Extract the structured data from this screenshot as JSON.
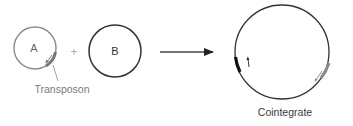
{
  "diagram": {
    "plasmid_a": {
      "label": "A",
      "stroke": "#8a8a8a",
      "transposon_color": "#7a7a7a"
    },
    "operator_plus": "+",
    "plasmid_b": {
      "label": "B",
      "stroke": "#333333"
    },
    "transposon_label": "Transposon",
    "reaction_arrow": "→",
    "cointegrate": {
      "label": "Cointegrate",
      "stroke": "#333333",
      "copy_1_color": "#111111",
      "copy_2_color": "#8a8a8a"
    }
  }
}
